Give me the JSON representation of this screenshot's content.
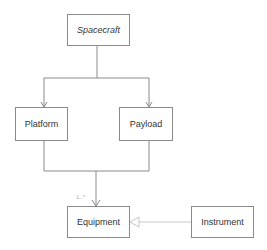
{
  "diagram": {
    "type": "uml-class-diagram",
    "classes": [
      {
        "id": "spacecraft",
        "label": "Spacecraft",
        "abstract": true
      },
      {
        "id": "platform",
        "label": "Platform"
      },
      {
        "id": "payload",
        "label": "Payload"
      },
      {
        "id": "equipment",
        "label": "Equipment"
      },
      {
        "id": "instrument",
        "label": "Instrument"
      }
    ],
    "relations": [
      {
        "from": "spacecraft",
        "to": "platform",
        "kind": "association-arrow"
      },
      {
        "from": "spacecraft",
        "to": "payload",
        "kind": "association-arrow"
      },
      {
        "from": "platform",
        "to": "equipment",
        "kind": "association-arrow",
        "multiplicity": "1..*"
      },
      {
        "from": "payload",
        "to": "equipment",
        "kind": "association-arrow",
        "multiplicity": "1..*"
      },
      {
        "from": "instrument",
        "to": "equipment",
        "kind": "generalization"
      }
    ],
    "multiplicity_label": "1..*"
  },
  "colors": {
    "line": "#8a8a8a",
    "generalization_line": "#c8c8c8",
    "text": "#333333"
  }
}
